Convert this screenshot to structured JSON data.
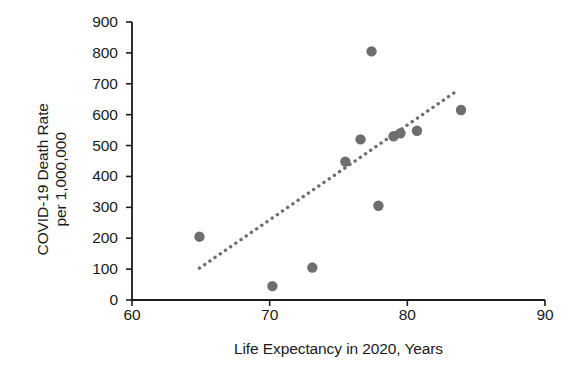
{
  "chart_data": {
    "type": "scatter",
    "title": "",
    "xlabel": "Life Expectancy in 2020, Years",
    "ylabel_line1": "COVID-19 Death Rate",
    "ylabel_line2": "per 1,000,000",
    "xlim": [
      60,
      90
    ],
    "ylim": [
      0,
      900
    ],
    "xticks": [
      60,
      70,
      80,
      90
    ],
    "yticks": [
      0,
      100,
      200,
      300,
      400,
      500,
      600,
      700,
      800,
      900
    ],
    "grid": false,
    "legend": null,
    "marker_color": "#6e6e6e",
    "axis_color": "#1a1a1a",
    "trend_color": "#6e6e6e",
    "trend_style": "dotted",
    "points": [
      {
        "x": 64.9,
        "y": 205
      },
      {
        "x": 70.2,
        "y": 45
      },
      {
        "x": 73.1,
        "y": 105
      },
      {
        "x": 75.5,
        "y": 448
      },
      {
        "x": 76.6,
        "y": 520
      },
      {
        "x": 77.4,
        "y": 805
      },
      {
        "x": 77.9,
        "y": 305
      },
      {
        "x": 79.0,
        "y": 530
      },
      {
        "x": 79.5,
        "y": 540
      },
      {
        "x": 80.7,
        "y": 548
      },
      {
        "x": 83.9,
        "y": 615
      }
    ],
    "trendline": {
      "x0": 64.9,
      "y0": 103,
      "x1": 83.7,
      "y1": 680
    }
  }
}
